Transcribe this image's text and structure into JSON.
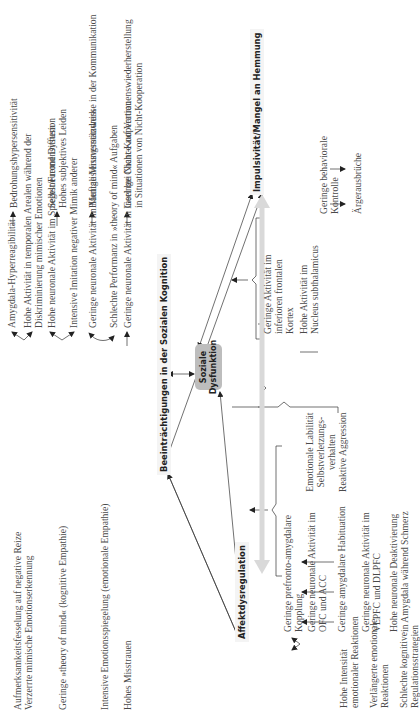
{
  "headings": {
    "social_cognition": "Beeinträchtigungen in der Sozialen Kognition",
    "center_box_line1": "Soziale",
    "center_box_line2": "Dysfunktion",
    "affect": "Affektdysregulation",
    "impulsivity": "Impulsivität/Mangel an Hemmung"
  },
  "social_cognition": {
    "rows": [
      {
        "symptom": [
          "Aufmerksamkeitsfesselung auf negative Reize",
          "Verzerrte mimische Emotionserkennung"
        ],
        "neural": [
          [
            "Amygdala-Hyperreagibilität"
          ],
          [
            "Hohe Aktivität in temporalen Arealen während der",
            "Diskriminierung mimischer Emotionen"
          ]
        ],
        "consequence": [
          "Bedrohungshypersensitivität"
        ]
      },
      {
        "symptom": [
          "Geringe »theory of mind« (kognitive Empathie)"
        ],
        "neural": [
          [
            "Hohe neuronale Aktivität im Spiegelneuronensystem"
          ],
          [
            "Intensive Imitation negativer Mimik anderer"
          ]
        ],
        "consequence": [
          "Selbst/Fremd Diffusion",
          "Hohes subjektives Leiden"
        ]
      },
      {
        "symptom": [
          "Intensive Emotionsspiegelung (emotionale Empathie)"
        ],
        "neural": [
          [
            "Geringe neuronale Aktivität im Mentalisierungsnetzwerk"
          ],
          [
            "Schlechte Performanz in »theory of mind« Aufgaben"
          ]
        ],
        "consequence": [
          "Häufige Missverständnisse in der Kommunikation"
        ]
      },
      {
        "symptom": [
          "Hohes Misstrauen"
        ],
        "neural": [
          [
            "Geringe neuronale Aktivität in Insel bei Nicht-Kooperation"
          ]
        ],
        "consequence": [
          "Geringe Chance auf Vertrauenswiederherstellung",
          "in Situationen von Nicht-Kooperation"
        ]
      }
    ]
  },
  "affect": {
    "rows": [
      {
        "symptom": [
          "Hohe Intensität",
          "emotionaler Reaktionen"
        ],
        "neural": [
          [
            "Geringe prefronto-amygdalare",
            "Kopplung"
          ],
          [
            "Geringe neuronale Aktivität im",
            "OFC und ACC"
          ]
        ]
      },
      {
        "symptom": [
          "Verlängerte emotionale",
          "Reaktionen"
        ],
        "neural": [
          [
            "Geringe amygdalare Habituation"
          ]
        ]
      },
      {
        "symptom": [
          "Schlechte kognitive",
          "Regulationsstrategien"
        ],
        "neural": [
          [
            "Geringe neuronale Aktivität im",
            "VLPFC und DLPFC"
          ]
        ]
      },
      {
        "symptom": [
          "Schmerz als emotionale",
          "Regulationsstrategie"
        ],
        "neural": [
          [
            "Hohe neuronale Deaktivierung",
            "in Amygdala während Schmerz"
          ]
        ]
      }
    ]
  },
  "shared_outcomes": [
    "Emotionale Labilität",
    "Selbstverletzungs-",
    "verhalten",
    "Reaktive Aggression"
  ],
  "impulsivity": {
    "neural": [
      [
        "Geringe Aktivität im",
        "inferioren frontalen",
        "Kortex"
      ],
      [
        "Hohe Aktivität im",
        "Nucleus subthalamicus"
      ]
    ],
    "consequences": [
      [
        "Geringe behaviorale",
        "Kontrolle"
      ],
      [
        "Ärgerausbrüche"
      ]
    ]
  },
  "colors": {
    "text": "#4a4a4a",
    "heading": "#222222",
    "box": "#bdbdbd",
    "grey_arrow": "#d9d9d9",
    "line": "#333333"
  }
}
